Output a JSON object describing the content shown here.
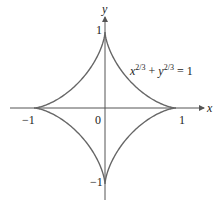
{
  "chart_data": {
    "type": "line",
    "title": "",
    "curve": "astroid",
    "equation": {
      "x_var": "x",
      "x_exp": "2/3",
      "plus": "+",
      "y_var": "y",
      "y_exp": "2/3",
      "rhs": "= 1"
    },
    "xlabel": "x",
    "ylabel": "y",
    "xlim": [
      -1.3,
      1.4
    ],
    "ylim": [
      -1.2,
      1.2
    ],
    "x_ticks": [
      "-1",
      "0",
      "1"
    ],
    "y_ticks": [
      "1",
      "-1"
    ],
    "grid": false,
    "series": [
      {
        "name": "x^(2/3) + y^(2/3) = 1",
        "points": [
          [
            1,
            0
          ],
          [
            0,
            1
          ],
          [
            -1,
            0
          ],
          [
            0,
            -1
          ]
        ]
      }
    ],
    "colors": {
      "curve": "#666666",
      "axis": "#555555"
    }
  },
  "labels": {
    "x_axis": "x",
    "y_axis": "y",
    "x_neg1": "−1",
    "x_0": "0",
    "x_1": "1",
    "y_1": "1",
    "y_neg1": "−1"
  }
}
